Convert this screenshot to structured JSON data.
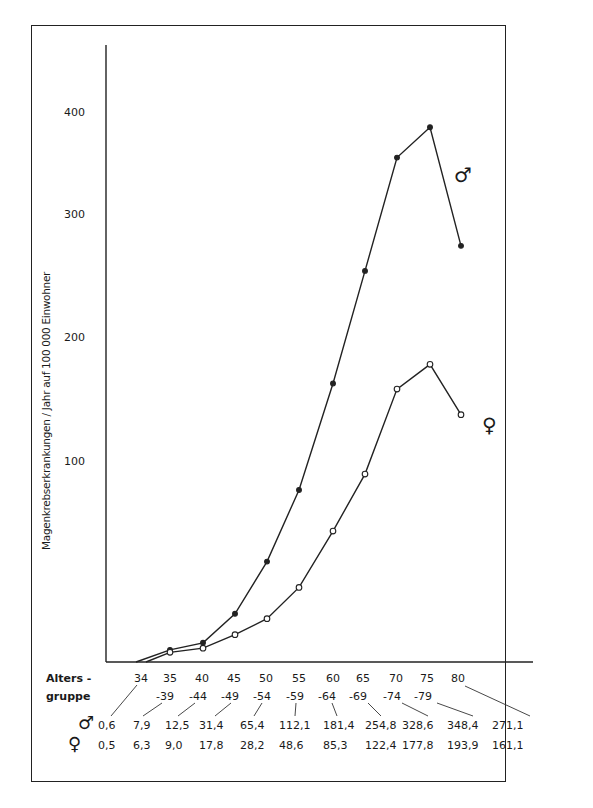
{
  "chart_data": {
    "type": "line",
    "title": "",
    "ylabel": "Magenkrebserkrankungen / Jahr auf 100 000 Einwohner",
    "xlabel": "Altersgruppe",
    "ylim": [
      0,
      400
    ],
    "yticks": [
      "100",
      "200",
      "300",
      "400"
    ],
    "grid": false,
    "legend_position": "inline at line ends",
    "categories": [
      "34",
      "35-39",
      "40-44",
      "45-49",
      "50-54",
      "55-59",
      "60-64",
      "65-69",
      "70-74",
      "75-79",
      "80"
    ],
    "series": [
      {
        "name": "♂",
        "marker": "filled circle",
        "values": [
          0.6,
          7.9,
          12.5,
          31.4,
          65.4,
          112.1,
          181.4,
          254.8,
          328.6,
          348.4,
          271.1
        ]
      },
      {
        "name": "♀",
        "marker": "open circle",
        "values": [
          0.5,
          6.3,
          9.0,
          17.8,
          28.2,
          48.6,
          85.3,
          122.4,
          177.8,
          193.9,
          161.1
        ]
      }
    ]
  },
  "axis": {
    "ylabel": "Magenkrebserkrankungen / Jahr  auf 100 000 Einwohner",
    "yticks": {
      "t100": "100",
      "t200": "200",
      "t300": "300",
      "t400": "400"
    },
    "xlabel_line1": "Alters -",
    "xlabel_line2": "gruppe"
  },
  "age_groups_top": [
    "34",
    "35",
    "40",
    "45",
    "50",
    "55",
    "60",
    "65",
    "70",
    "75",
    "80"
  ],
  "age_groups_bottom": [
    "-39",
    "-44",
    "-49",
    "-54",
    "-59",
    "-64",
    "-69",
    "-74",
    "-79"
  ],
  "table": {
    "male_symbol": "♂",
    "female_symbol": "♀",
    "male_values": [
      "0,6",
      "7,9",
      "12,5",
      "31,4",
      "65,4",
      "112,1",
      "181,4",
      "254,8",
      "328,6",
      "348,4",
      "271,1"
    ],
    "female_values": [
      "0,5",
      "6,3",
      "9,0",
      "17,8",
      "28,2",
      "48,6",
      "85,3",
      "122,4",
      "177,8",
      "193,9",
      "161,1"
    ]
  },
  "legend": {
    "male": "♂",
    "female": "♀"
  }
}
